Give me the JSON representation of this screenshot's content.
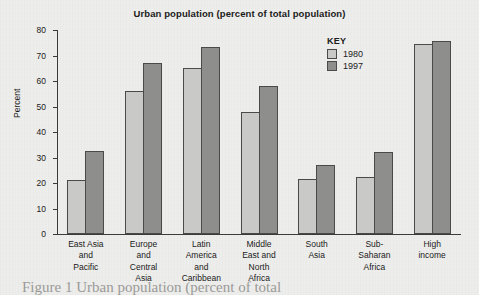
{
  "chart_data": {
    "type": "bar",
    "title": "Urban population (percent of total population)",
    "xlabel": "",
    "ylabel": "Percent",
    "ylim": [
      0,
      80
    ],
    "yticks": [
      0,
      10,
      20,
      30,
      40,
      50,
      60,
      70,
      80
    ],
    "grid": false,
    "legend_position": "upper-right",
    "legend_title": "KEY",
    "categories": [
      "East Asia and Pacific",
      "Europe and Central Asia",
      "Latin America and Caribbean",
      "Middle East and North Africa",
      "South Asia",
      "Sub-Saharan Africa",
      "High income"
    ],
    "category_label_lines": [
      [
        "East Asia",
        "and",
        "Pacific"
      ],
      [
        "Europe",
        "and",
        "Central",
        "Asia"
      ],
      [
        "Latin",
        "America",
        "and",
        "Caribbean"
      ],
      [
        "Middle",
        "East and",
        "North",
        "Africa"
      ],
      [
        "South",
        "Asia"
      ],
      [
        "Sub-",
        "Saharan",
        "Africa"
      ],
      [
        "High",
        "income"
      ]
    ],
    "series": [
      {
        "name": "1980",
        "color": "#c9c9c7",
        "values": [
          21,
          56,
          65,
          48,
          21.5,
          22.5,
          74.5
        ]
      },
      {
        "name": "1997",
        "color": "#8e8e8c",
        "values": [
          32.5,
          67,
          73.5,
          58,
          27,
          32,
          75.5
        ]
      }
    ]
  },
  "legend": {
    "title": "KEY",
    "entries": [
      {
        "label": "1980",
        "color": "#c9c9c7"
      },
      {
        "label": "1997",
        "color": "#8e8e8c"
      }
    ]
  },
  "axes": {
    "y_title": "Percent",
    "y_ticks": [
      "80",
      "70",
      "60",
      "50",
      "40",
      "30",
      "20",
      "10",
      "0"
    ]
  },
  "caption_sliver": "Figure 1 Urban population (percent of total"
}
